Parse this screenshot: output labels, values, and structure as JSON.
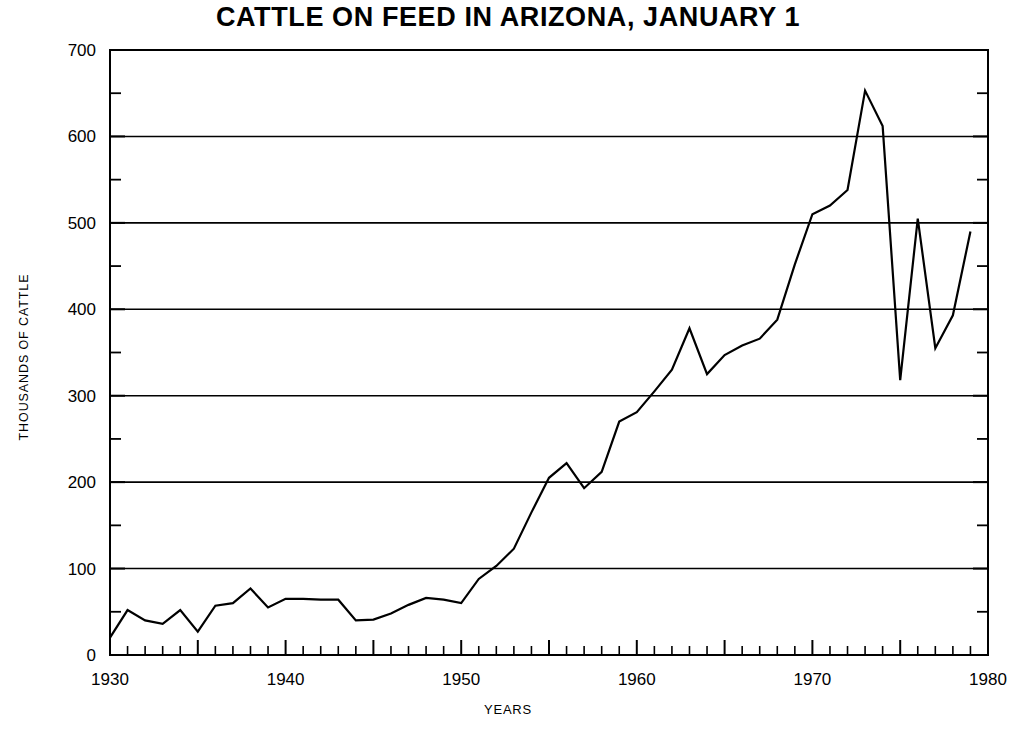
{
  "chart_data": {
    "type": "line",
    "title": "CATTLE ON FEED IN ARIZONA, JANUARY 1",
    "xlabel": "YEARS",
    "ylabel": "THOUSANDS OF CATTLE",
    "xlim": [
      1930,
      1980
    ],
    "ylim": [
      0,
      700
    ],
    "xticks": [
      1930,
      1940,
      1950,
      1960,
      1970,
      1980
    ],
    "xtick_labels": [
      "1930",
      "1940",
      "1950",
      "1960",
      "1970",
      "1980"
    ],
    "x_minor_tick_interval": 1,
    "x_major_tick_interval": 5,
    "yticks": [
      0,
      100,
      200,
      300,
      400,
      500,
      600,
      700
    ],
    "ytick_labels": [
      "0",
      "100",
      "200",
      "300",
      "400",
      "500",
      "600",
      "700"
    ],
    "y_minor_tick_interval": 50,
    "grid": "horizontal gridlines at every 100",
    "legend": "none",
    "line_color": "#000000",
    "x": [
      1930,
      1931,
      1932,
      1933,
      1934,
      1935,
      1936,
      1937,
      1938,
      1939,
      1940,
      1941,
      1942,
      1943,
      1944,
      1945,
      1946,
      1947,
      1948,
      1949,
      1950,
      1951,
      1952,
      1953,
      1954,
      1955,
      1956,
      1957,
      1958,
      1959,
      1960,
      1961,
      1962,
      1963,
      1964,
      1965,
      1966,
      1967,
      1968,
      1969,
      1970,
      1971,
      1972,
      1973,
      1974,
      1975,
      1976,
      1977,
      1978,
      1979
    ],
    "values": [
      20,
      52,
      40,
      36,
      52,
      27,
      57,
      60,
      77,
      55,
      65,
      65,
      64,
      64,
      40,
      41,
      48,
      58,
      66,
      64,
      60,
      88,
      103,
      123,
      165,
      205,
      222,
      193,
      212,
      270,
      281,
      305,
      330,
      378,
      325,
      347,
      358,
      366,
      388,
      452,
      510,
      520,
      538,
      653,
      612,
      318,
      505,
      355,
      393,
      490
    ]
  },
  "axis": {
    "y_axis_name": "thousands-of-cattle-axis",
    "x_axis_name": "years-axis"
  }
}
